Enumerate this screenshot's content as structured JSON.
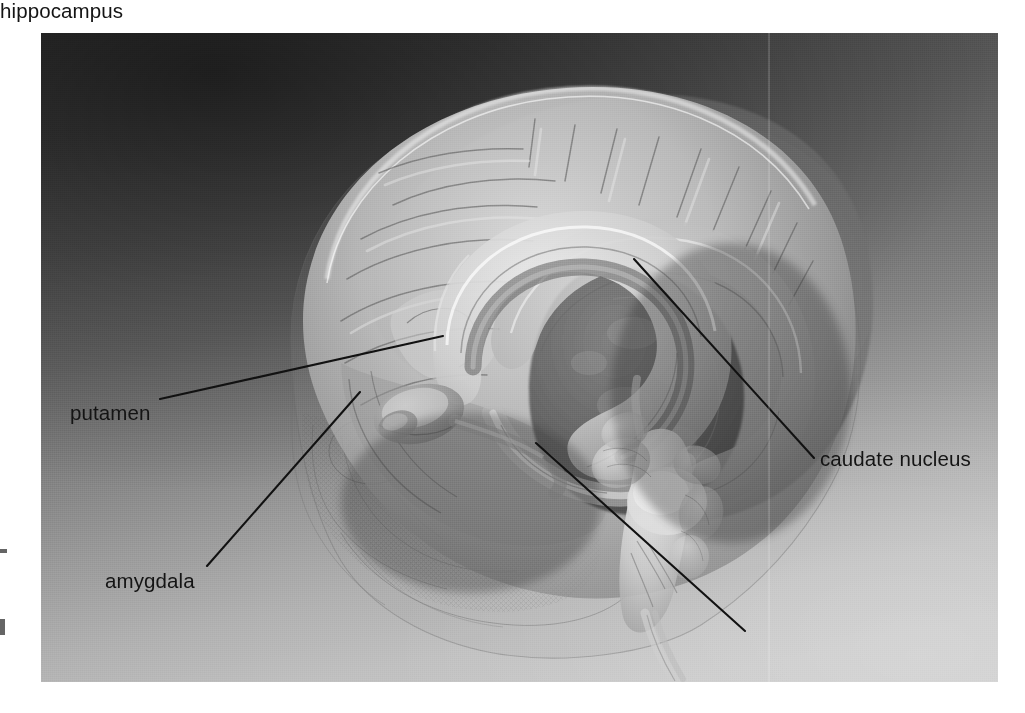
{
  "figure": {
    "kind": "anatomical-illustration",
    "palette": {
      "background_dark": "#3a3a3a",
      "background_light": "#cbcbcb",
      "leader_line": "#111111",
      "label_text": "#141414",
      "page": "#ffffff"
    },
    "frame": {
      "left": 41,
      "top": 33,
      "width": 957,
      "height": 649
    }
  },
  "labels": [
    {
      "id": "putamen",
      "text": "putamen",
      "text_x": 70,
      "text_y": 402,
      "leader": {
        "x1": 160,
        "y1": 399,
        "x2": 443,
        "y2": 336
      },
      "side": "left"
    },
    {
      "id": "amygdala",
      "text": "amygdala",
      "text_x": 105,
      "text_y": 570,
      "leader": {
        "x1": 207,
        "y1": 566,
        "x2": 360,
        "y2": 392
      },
      "side": "left"
    },
    {
      "id": "caudate_nucleus",
      "text": "caudate nucleus",
      "text_x": 820,
      "text_y": 448,
      "leader": {
        "x1": 634,
        "y1": 259,
        "x2": 814,
        "y2": 458
      },
      "side": "right"
    },
    {
      "id": "hippocampus",
      "text": "hippocampus",
      "text_x": 750,
      "text_y": 618,
      "leader": {
        "x1": 536,
        "y1": 443,
        "x2": 745,
        "y2": 631
      },
      "side": "right"
    }
  ],
  "structures": [
    {
      "name": "cerebral cortex",
      "note": "outer translucent hemisphere with gyri and sulci"
    },
    {
      "name": "corpus callosum",
      "note": "large pale arching band in the centre"
    },
    {
      "name": "caudate nucleus",
      "note": "C-shaped body arching over the thalamus"
    },
    {
      "name": "putamen",
      "note": "lens-shaped mass lateral to the globus pallidus"
    },
    {
      "name": "amygdala",
      "note": "almond-shaped nucleus at the temporal pole"
    },
    {
      "name": "hippocampus",
      "note": "curved structure in the medial temporal lobe"
    },
    {
      "name": "thalamus",
      "note": "dark ovoid mass at centre"
    },
    {
      "name": "brainstem",
      "note": "midbrain, pons and medulla descending at lower right"
    },
    {
      "name": "cerebellum",
      "note": "lobed mass posterior to the brainstem"
    },
    {
      "name": "skull wireframe",
      "note": "mesh outline of cranium and facial bones"
    }
  ],
  "margin_fragments": [
    {
      "id": "fragment-upper",
      "note": "cropped glyph fragment at left page edge"
    },
    {
      "id": "fragment-lower",
      "note": "cropped glyph fragment at left page edge"
    }
  ]
}
